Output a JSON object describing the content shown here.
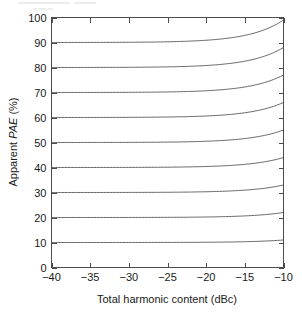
{
  "chart_data": {
    "type": "line",
    "title": "",
    "xlabel": "Total harmonic content (dBc)",
    "ylabel": "Apparent PAE (%)",
    "ylabel_parts": {
      "prefix": "Apparent ",
      "italic": "PAE",
      "suffix": " (%)"
    },
    "xlim": [
      -40,
      -10
    ],
    "ylim": [
      0,
      100
    ],
    "xticks": [
      -40,
      -35,
      -30,
      -25,
      -20,
      -15,
      -10
    ],
    "xtick_labels": [
      "−40",
      "−35",
      "−30",
      "−25",
      "−20",
      "−15",
      "−10"
    ],
    "yticks": [
      0,
      10,
      20,
      30,
      40,
      50,
      60,
      70,
      80,
      90,
      100
    ],
    "ytick_labels": [
      "0",
      "10",
      "20",
      "30",
      "40",
      "50",
      "60",
      "70",
      "80",
      "90",
      "100"
    ],
    "grid": false,
    "legend": false,
    "legend_position": "none",
    "x": [
      -40,
      -37.5,
      -35,
      -32.5,
      -30,
      -27.5,
      -25,
      -22.5,
      -20,
      -17.5,
      -15,
      -12.5,
      -10
    ],
    "series": [
      {
        "name": "ideal PAE = 10%",
        "ideal_pae": 10,
        "values": [
          10.0,
          10.0,
          10.0,
          10.1,
          10.1,
          10.2,
          10.3,
          10.6,
          11.0,
          10.9,
          10.9,
          10.9,
          11.0
        ]
      },
      {
        "name": "ideal PAE = 20%",
        "ideal_pae": 20,
        "values": [
          20.0,
          20.0,
          20.1,
          20.1,
          20.2,
          20.4,
          20.6,
          21.1,
          21.7,
          21.4,
          21.5,
          21.6,
          21.7
        ]
      },
      {
        "name": "ideal PAE = 30%",
        "ideal_pae": 30,
        "values": [
          30.0,
          30.1,
          30.1,
          30.2,
          30.3,
          30.5,
          31.0,
          31.7,
          32.6,
          32.2,
          32.4,
          32.6,
          32.8
        ]
      },
      {
        "name": "ideal PAE = 40%",
        "ideal_pae": 40,
        "values": [
          40.0,
          40.1,
          40.1,
          40.2,
          40.4,
          40.7,
          41.3,
          42.2,
          43.5,
          42.9,
          43.2,
          43.5,
          43.8
        ]
      },
      {
        "name": "ideal PAE = 50%",
        "ideal_pae": 50,
        "values": [
          50.0,
          50.1,
          50.2,
          50.3,
          50.5,
          50.9,
          51.6,
          52.8,
          54.3,
          53.6,
          54.0,
          54.4,
          54.7
        ]
      },
      {
        "name": "ideal PAE = 60%",
        "ideal_pae": 60,
        "values": [
          60.0,
          60.1,
          60.2,
          60.4,
          60.6,
          61.1,
          61.9,
          63.3,
          65.2,
          64.3,
          64.8,
          65.2,
          65.6
        ]
      },
      {
        "name": "ideal PAE = 70%",
        "ideal_pae": 70,
        "values": [
          70.0,
          70.1,
          70.2,
          70.4,
          70.7,
          71.2,
          72.2,
          73.9,
          76.1,
          75.0,
          75.6,
          76.1,
          76.6
        ]
      },
      {
        "name": "ideal PAE = 80%",
        "ideal_pae": 80,
        "values": [
          80.0,
          80.1,
          80.3,
          80.5,
          80.8,
          81.4,
          82.5,
          84.4,
          86.9,
          85.7,
          86.4,
          87.0,
          87.5
        ]
      },
      {
        "name": "ideal PAE = 90%",
        "ideal_pae": 90,
        "values": [
          90.0,
          90.1,
          90.3,
          90.6,
          90.9,
          91.6,
          92.8,
          95.0,
          97.8,
          96.4,
          97.2,
          97.8,
          98.5
        ]
      },
      {
        "name": "ideal PAE = 100%",
        "ideal_pae": 100,
        "values": [
          100.0,
          100.0,
          100.0,
          100.0,
          100.0,
          100.0,
          100.0,
          100.0,
          100.0,
          100.0,
          100.0,
          100.0,
          100.0
        ]
      }
    ]
  }
}
